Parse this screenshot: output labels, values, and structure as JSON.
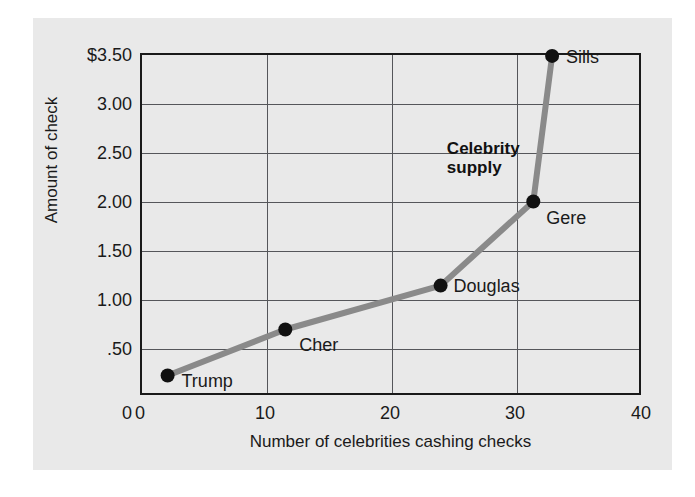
{
  "chart_data": {
    "type": "line",
    "title": "",
    "xlabel": "Number of celebrities cashing checks",
    "ylabel": "Amount of check",
    "xlim": [
      0,
      40
    ],
    "ylim": [
      0,
      3.5
    ],
    "grid": true,
    "legend": "none",
    "x_ticks": [
      "0",
      "10",
      "20",
      "30",
      "40"
    ],
    "x_tick_values": [
      0,
      10,
      20,
      30,
      40
    ],
    "y_ticks": [
      "0",
      ".50",
      "1.00",
      "1.50",
      "2.00",
      "2.50",
      "3.00",
      "$3.50"
    ],
    "y_tick_values": [
      0,
      0.5,
      1.0,
      1.5,
      2.0,
      2.5,
      3.0,
      3.5
    ],
    "series": [
      {
        "name": "Celebrity supply",
        "color": "#8a8a8a",
        "marker_color": "#111111",
        "points": [
          {
            "label": "Trump",
            "x": 2.2,
            "y": 0.2
          },
          {
            "label": "Cher",
            "x": 11.6,
            "y": 0.67
          },
          {
            "label": "Douglas",
            "x": 24.0,
            "y": 1.12
          },
          {
            "label": "Gere",
            "x": 31.4,
            "y": 1.98
          },
          {
            "label": "Sills",
            "x": 32.9,
            "y": 3.47
          }
        ]
      }
    ],
    "annotations": [
      {
        "text": "Celebrity\nsupply",
        "x": 24.5,
        "y": 2.62,
        "bold": true
      }
    ]
  },
  "colors": {
    "panel_background": "#e9e9e9",
    "frame": "#1a1a1a",
    "gridline": "#55565a",
    "line": "#8a8a8a",
    "marker": "#111111",
    "text": "#1a1a1a"
  }
}
